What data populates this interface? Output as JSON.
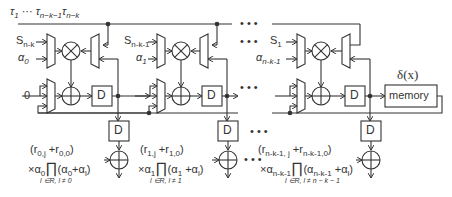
{
  "diagram": {
    "top_bus_label": {
      "tau1": "τ",
      "tau1_sub": "1",
      "dots": " ··· ",
      "tau2": "τ",
      "tau2_sub": "n−k−1",
      "tau3": "τ",
      "tau3_sub": "n−k"
    },
    "ellipsis": "• • •",
    "columns": [
      {
        "s_label": "S",
        "s_sub": "n-k",
        "alpha_label": "α",
        "alpha_sub": "0",
        "zero_input": "0",
        "expr_line1": "(r",
        "expr_line1_sub1": "0,j",
        "expr_line1_mid": " +r",
        "expr_line1_sub2": "0,0",
        "expr_line1_end": ")",
        "expr_line2_prefix": "×α",
        "expr_line2_sub": "0",
        "expr_prod": "∏",
        "expr_line2_rest": "(α",
        "expr_line2_rest_sub": "0",
        "expr_line2_end": "+α",
        "expr_line2_end_sub": "l",
        "expr_line2_close": ")",
        "expr_index": "l ∈R, l ≠ 0"
      },
      {
        "s_label": "S",
        "s_sub": "n-k-1",
        "alpha_label": "α",
        "alpha_sub": "1",
        "expr_line1": "(r",
        "expr_line1_sub1": "1,j",
        "expr_line1_mid": " +r",
        "expr_line1_sub2": "1,0",
        "expr_line1_end": ")",
        "expr_line2_prefix": "×α",
        "expr_line2_sub": "1",
        "expr_prod": "∏",
        "expr_line2_rest": "(α",
        "expr_line2_rest_sub": "1",
        "expr_line2_end": " +α",
        "expr_line2_end_sub": "l",
        "expr_line2_close": ")",
        "expr_index": "l ∈R, l ≠ 1"
      },
      {
        "s_label": "S",
        "s_sub": "1",
        "alpha_label": "α",
        "alpha_sub": "n-k-1",
        "expr_line1": "(r",
        "expr_line1_sub1": "n-k-1, j",
        "expr_line1_mid": " +r",
        "expr_line1_sub2": "n-k-1,0",
        "expr_line1_end": ")",
        "expr_line2_prefix": "×α",
        "expr_line2_sub": "n-k-1",
        "expr_prod": "∏",
        "expr_line2_rest": "(α",
        "expr_line2_rest_sub": "n-k-1",
        "expr_line2_end": " +α",
        "expr_line2_end_sub": "l",
        "expr_line2_close": ")",
        "expr_index": "l ∈R, l ≠ n − k − 1"
      }
    ],
    "register_label": "D",
    "memory_label": "memory",
    "memory_title": "δ(x)",
    "colors": {
      "line": "#333333",
      "background": "#ffffff"
    }
  }
}
